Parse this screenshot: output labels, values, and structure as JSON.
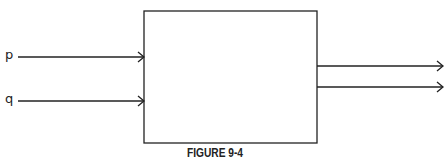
{
  "diagram": {
    "type": "block-diagram",
    "inputs": [
      {
        "label": "p"
      },
      {
        "label": "q"
      }
    ],
    "outputs": [
      {
        "label": ""
      },
      {
        "label": ""
      }
    ],
    "caption": "FIGURE 9-4",
    "colors": {
      "stroke": "#222222",
      "background": "#ffffff"
    }
  }
}
